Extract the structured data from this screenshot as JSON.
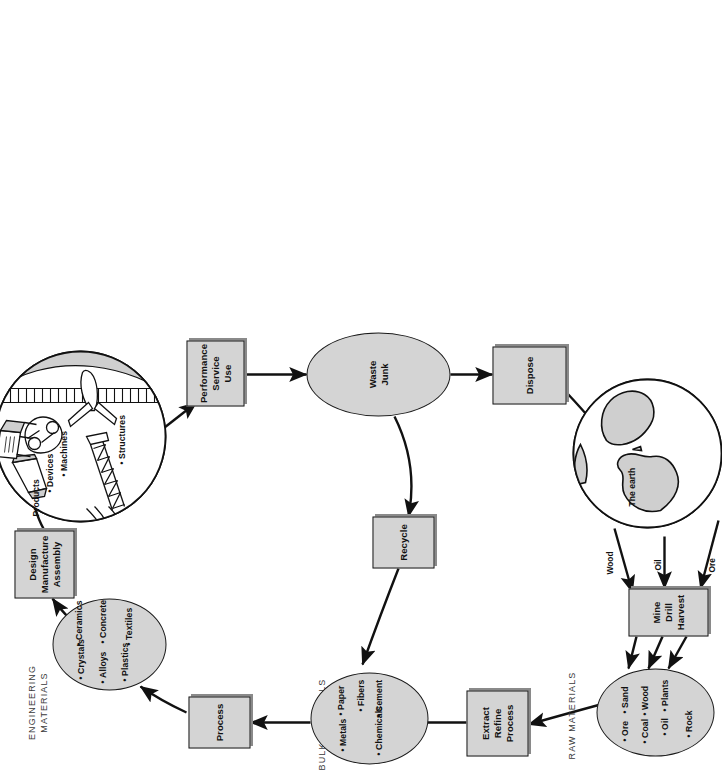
{
  "diagram": {
    "group_labels": {
      "engineering_materials": "ENGINEERING\nMATERIALS",
      "bulk_materials": "BULK MATERIALS",
      "raw_materials": "RAW MATERIALS"
    },
    "nodes": {
      "engineering_materials_ellipse": {
        "name": "Engineering materials",
        "items": [
          "Crystals",
          "Ceramics",
          "Alloys",
          "Plastics",
          "Concrete",
          "Textiles"
        ]
      },
      "design_box": {
        "lines": [
          "Design",
          "Manufacture",
          "Assembly"
        ]
      },
      "products_circle": {
        "label": "Products",
        "items": [
          "Devices",
          "Machines",
          "Structures"
        ]
      },
      "performance_box": {
        "lines": [
          "Performance",
          "Service",
          "Use"
        ]
      },
      "waste_ellipse": {
        "lines": [
          "Waste",
          "Junk"
        ]
      },
      "dispose_box": {
        "lines": [
          "Dispose"
        ]
      },
      "recycle_box": {
        "lines": [
          "Recycle"
        ]
      },
      "bulk_materials_ellipse": {
        "name": "Bulk materials",
        "items": [
          "Metals",
          "Paper",
          "Chemicals",
          "Cement",
          "Fibers"
        ]
      },
      "process_box": {
        "lines": [
          "Process"
        ]
      },
      "extract_box": {
        "lines": [
          "Extract",
          "Refine",
          "Process"
        ]
      },
      "raw_materials_ellipse": {
        "name": "Raw materials",
        "items": [
          "Ore",
          "Coal",
          "Oil",
          "Sand",
          "Wood",
          "Plants",
          "Rock"
        ]
      },
      "mine_box": {
        "lines": [
          "Mine",
          "Drill",
          "Harvest"
        ]
      },
      "earth_circle": {
        "label": "The earth"
      }
    },
    "edge_labels": {
      "wood": "Wood",
      "oil": "Oil",
      "ore": "Ore"
    },
    "colors": {
      "fill_gray": "#d4d4d4",
      "stroke": "#1a1a1a",
      "shadow": "#8a8a8a",
      "paper": "#ffffff",
      "label_gray": "#3a3a3a"
    }
  }
}
